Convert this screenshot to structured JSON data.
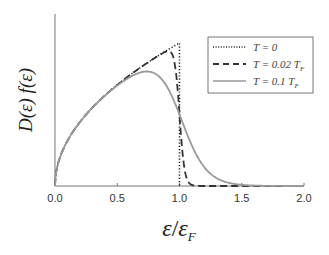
{
  "chart_data": {
    "type": "line",
    "title": "",
    "xlabel": "ε / ε_F",
    "ylabel": "D(ε) f(ε)",
    "xlim": [
      0,
      2.0
    ],
    "ylim": [
      0,
      1.15
    ],
    "xticks": [
      "0.0",
      "0.5",
      "1.0",
      "1.5",
      "2.0"
    ],
    "grid": false,
    "legend_position": "upper right (boxed)",
    "series": [
      {
        "name": "T = 0",
        "style": "dotted",
        "color": "#222222",
        "x": [
          0,
          0.25,
          0.5,
          0.75,
          1.0,
          1.0,
          2.0
        ],
        "y": [
          0,
          0.5,
          0.707,
          0.866,
          1.0,
          0,
          0
        ]
      },
      {
        "name": "T = 0.02 T_F",
        "style": "dashed",
        "color": "#333333",
        "x": [
          0,
          0.25,
          0.5,
          0.75,
          0.9,
          0.95,
          1.0,
          1.05,
          1.1,
          1.5,
          2.0
        ],
        "y": [
          0,
          0.5,
          0.707,
          0.866,
          0.943,
          0.898,
          0.5,
          0.07,
          0.01,
          0,
          0
        ]
      },
      {
        "name": "T = 0.1 T_F",
        "style": "solid",
        "color": "#999999",
        "x": [
          0,
          0.25,
          0.5,
          0.6,
          0.75,
          0.9,
          1.0,
          1.1,
          1.2,
          1.3,
          1.5,
          2.0
        ],
        "y": [
          0,
          0.49,
          0.66,
          0.7,
          0.72,
          0.65,
          0.5,
          0.32,
          0.16,
          0.07,
          0.01,
          0
        ]
      }
    ]
  },
  "legend": {
    "items": [
      {
        "label_main": "T = 0",
        "label_sub": ""
      },
      {
        "label_main": "T = 0.02 T",
        "label_sub": "F"
      },
      {
        "label_main": "T = 0.1 T",
        "label_sub": "F"
      }
    ]
  },
  "axes": {
    "xlabel_eps": "ε",
    "xlabel_slash": "/",
    "xlabel_epsF": "ε",
    "xlabel_sub": "F",
    "ylabel": "D(ε) f(ε)"
  }
}
